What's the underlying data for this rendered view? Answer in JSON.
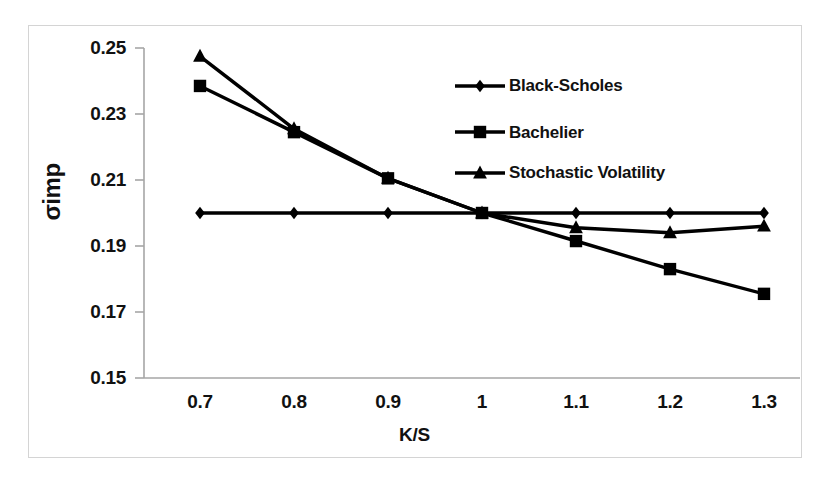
{
  "chart_data": {
    "type": "line",
    "title": "",
    "xlabel": "K/S",
    "ylabel": "σimp",
    "x": [
      0.7,
      0.8,
      0.9,
      1,
      1.1,
      1.2,
      1.3
    ],
    "xtick_labels": [
      "0.7",
      "0.8",
      "0.9",
      "1",
      "1.1",
      "1.2",
      "1.3"
    ],
    "ytick_labels": [
      "0.25",
      "0.23",
      "0.21",
      "0.19",
      "0.17",
      "0.15"
    ],
    "ytick_values": [
      0.25,
      0.23,
      0.21,
      0.19,
      0.17,
      0.15
    ],
    "ylim": [
      0.15,
      0.25
    ],
    "xlim": [
      0.65,
      1.35
    ],
    "grid": false,
    "legend_position": "upper-right-inside",
    "series": [
      {
        "name": "Black-Scholes",
        "marker": "diamond",
        "color": "#000000",
        "values": [
          0.2,
          0.2,
          0.2,
          0.2,
          0.2,
          0.2,
          0.2
        ]
      },
      {
        "name": "Bachelier",
        "marker": "square",
        "color": "#000000",
        "values": [
          0.2385,
          0.2245,
          0.2105,
          0.2,
          0.1915,
          0.183,
          0.1755
        ]
      },
      {
        "name": "Stochastic Volatility",
        "marker": "triangle",
        "color": "#000000",
        "values": [
          0.2475,
          0.2255,
          0.2105,
          0.2,
          0.1955,
          0.194,
          0.196
        ]
      }
    ]
  },
  "figure": {
    "frame_color": "#d4d4d4",
    "axis_color": "#a6a6a6",
    "background": "#ffffff"
  }
}
